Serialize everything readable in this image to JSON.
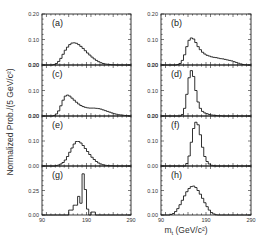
{
  "chart_data": {
    "type": "bar",
    "figure": {
      "xlabel": "m_t (GeV/c^2)",
      "xlabel_display": "mt (GeV/c²)",
      "ylabel": "Normalized Prob./(5 GeV/c^2)",
      "ylabel_display": "Normalized Prob./(5 GeV/c²)",
      "xlim": [
        90,
        290
      ],
      "xticks": [
        90,
        190,
        290
      ],
      "layout": "4 rows x 2 columns, shared x axis",
      "grid": false,
      "legend": "none"
    },
    "panels": [
      {
        "label": "(a)",
        "ylim": [
          0,
          0.2
        ],
        "yticks": [
          "0.00",
          "0.10",
          "0.20"
        ],
        "bin_start": 90,
        "bin_width": 5,
        "values": [
          0,
          0,
          0,
          0,
          0,
          0.002,
          0.006,
          0.014,
          0.026,
          0.042,
          0.058,
          0.07,
          0.08,
          0.086,
          0.087,
          0.085,
          0.08,
          0.073,
          0.065,
          0.056,
          0.047,
          0.039,
          0.031,
          0.024,
          0.018,
          0.013,
          0.009,
          0.006,
          0.004,
          0.003,
          0.002,
          0.001,
          0.001,
          0,
          0,
          0,
          0,
          0,
          0,
          0
        ]
      },
      {
        "label": "(b)",
        "ylim": [
          0,
          0.2
        ],
        "yticks": [
          "0.00",
          "0.10",
          "0.20"
        ],
        "bin_start": 90,
        "bin_width": 5,
        "values": [
          0,
          0,
          0,
          0,
          0,
          0,
          0,
          0.002,
          0.006,
          0.018,
          0.04,
          0.072,
          0.097,
          0.106,
          0.102,
          0.088,
          0.072,
          0.06,
          0.05,
          0.043,
          0.038,
          0.035,
          0.032,
          0.03,
          0.029,
          0.027,
          0.025,
          0.024,
          0.022,
          0.02,
          0.018,
          0.016,
          0.013,
          0.01,
          0.007,
          0.004,
          0.002,
          0.001,
          0,
          0
        ]
      },
      {
        "label": "(c)",
        "ylim": [
          0,
          0.2
        ],
        "yticks": [
          "0.00",
          "0.10",
          "0.20"
        ],
        "bin_start": 90,
        "bin_width": 5,
        "values": [
          0,
          0,
          0,
          0,
          0,
          0.002,
          0.008,
          0.02,
          0.04,
          0.062,
          0.078,
          0.082,
          0.078,
          0.07,
          0.062,
          0.054,
          0.047,
          0.041,
          0.037,
          0.034,
          0.032,
          0.031,
          0.031,
          0.031,
          0.03,
          0.029,
          0.027,
          0.024,
          0.021,
          0.018,
          0.015,
          0.012,
          0.009,
          0.007,
          0.005,
          0.004,
          0.003,
          0.002,
          0.001,
          0
        ]
      },
      {
        "label": "(d)",
        "ylim": [
          0,
          0.2
        ],
        "yticks": [
          "0.00",
          "0.10",
          "0.20"
        ],
        "bin_start": 90,
        "bin_width": 5,
        "values": [
          0,
          0,
          0,
          0,
          0,
          0,
          0,
          0,
          0,
          0.006,
          0.03,
          0.085,
          0.15,
          0.178,
          0.155,
          0.1,
          0.055,
          0.03,
          0.018,
          0.012,
          0.009,
          0.006,
          0.004,
          0.003,
          0.002,
          0.001,
          0.001,
          0,
          0,
          0,
          0,
          0,
          0,
          0,
          0,
          0,
          0,
          0,
          0,
          0
        ]
      },
      {
        "label": "(e)",
        "ylim": [
          0,
          0.2
        ],
        "yticks": [
          "0.00",
          "0.10",
          "0.20"
        ],
        "bin_start": 90,
        "bin_width": 5,
        "values": [
          0,
          0,
          0,
          0,
          0,
          0,
          0.002,
          0.004,
          0.008,
          0.014,
          0.024,
          0.038,
          0.055,
          0.072,
          0.088,
          0.098,
          0.098,
          0.092,
          0.082,
          0.07,
          0.058,
          0.046,
          0.035,
          0.026,
          0.018,
          0.012,
          0.008,
          0.005,
          0.003,
          0.002,
          0.001,
          0.001,
          0,
          0,
          0,
          0,
          0,
          0,
          0,
          0
        ]
      },
      {
        "label": "(f)",
        "ylim": [
          0,
          0.2
        ],
        "yticks": [
          "0.00",
          "0.10",
          "0.20"
        ],
        "bin_start": 90,
        "bin_width": 5,
        "values": [
          0,
          0,
          0,
          0,
          0,
          0,
          0,
          0,
          0,
          0,
          0,
          0.01,
          0.04,
          0.095,
          0.15,
          0.175,
          0.165,
          0.125,
          0.075,
          0.038,
          0.018,
          0.008,
          0.003,
          0.001,
          0,
          0,
          0,
          0,
          0,
          0,
          0,
          0,
          0,
          0,
          0,
          0,
          0,
          0,
          0,
          0
        ]
      },
      {
        "label": "(g)",
        "ylim": [
          0,
          0.5
        ],
        "yticks": [
          "0.00",
          "0.25",
          ""
        ],
        "bin_start": 90,
        "bin_width": 5,
        "values": [
          0,
          0,
          0,
          0,
          0,
          0,
          0,
          0,
          0,
          0,
          0,
          0,
          0.05,
          0.05,
          0.1,
          0.1,
          0.19,
          0.12,
          0.42,
          0.26,
          0.06,
          0,
          0.03,
          0.03,
          0,
          0,
          0,
          0,
          0,
          0,
          0,
          0,
          0,
          0,
          0,
          0,
          0,
          0,
          0,
          0
        ]
      },
      {
        "label": "(h)",
        "ylim": [
          0,
          0.2
        ],
        "yticks": [
          "0.00",
          "0.10",
          ""
        ],
        "bin_start": 90,
        "bin_width": 5,
        "values": [
          0,
          0,
          0,
          0,
          0.002,
          0.006,
          0.014,
          0.026,
          0.042,
          0.06,
          0.078,
          0.095,
          0.108,
          0.116,
          0.118,
          0.112,
          0.1,
          0.085,
          0.068,
          0.05,
          0.034,
          0.02,
          0.01,
          0.004,
          0.001,
          0,
          0,
          0,
          0,
          0,
          0,
          0,
          0,
          0,
          0,
          0,
          0,
          0,
          0,
          0
        ]
      }
    ]
  },
  "labels": {
    "ylabel": "Normalized Prob./(5 GeV/c²)",
    "xlabel_main": "m",
    "xlabel_sub": "t",
    "xlabel_units": " (GeV/c²)",
    "xtick_left": "90",
    "xtick_mid": "190",
    "xtick_right": "290"
  },
  "colors": {
    "axes": "#222222",
    "line": "#1a1a1a",
    "text": "#333333",
    "background": "#ffffff"
  }
}
